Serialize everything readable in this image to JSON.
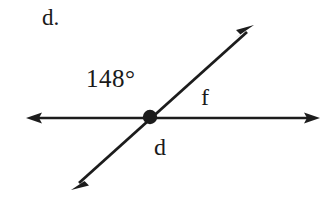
{
  "figure": {
    "item_label": "d.",
    "angle_label": "148°",
    "ray_label_f": "f",
    "ray_label_d": "d",
    "stroke_color": "#1c1c1c",
    "background_color": "#ffffff",
    "vertex": {
      "x": 150,
      "y": 117
    },
    "lines": [
      {
        "name": "horizontal-line",
        "from": {
          "x": 28,
          "y": 118
        },
        "to": {
          "x": 318,
          "y": 118
        },
        "arrows": "both"
      },
      {
        "name": "diagonal-line",
        "from": {
          "x": 73,
          "y": 188
        },
        "to": {
          "x": 253,
          "y": 26
        },
        "arrows": "both"
      }
    ]
  }
}
